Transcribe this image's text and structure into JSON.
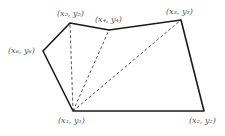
{
  "figure": {
    "vertices": [
      {
        "id": 1,
        "label": "(x₁, y₁)"
      },
      {
        "id": 2,
        "label": "(x₂, y₂)"
      },
      {
        "id": 3,
        "label": "(x₃, y₃)"
      },
      {
        "id": 4,
        "label": "(x₄, y₄)"
      },
      {
        "id": 5,
        "label": "(x₅, y₅)"
      },
      {
        "id": 6,
        "label": "(x₆, y₆)"
      }
    ],
    "edges": [
      [
        1,
        2
      ],
      [
        2,
        3
      ],
      [
        3,
        4
      ],
      [
        4,
        5
      ],
      [
        5,
        6
      ],
      [
        6,
        1
      ]
    ],
    "diagonals": [
      [
        1,
        3
      ],
      [
        1,
        4
      ],
      [
        1,
        5
      ]
    ],
    "colors": {
      "edge": "#1a1a1a",
      "diagonal": "#444444",
      "label": "#555555"
    }
  }
}
